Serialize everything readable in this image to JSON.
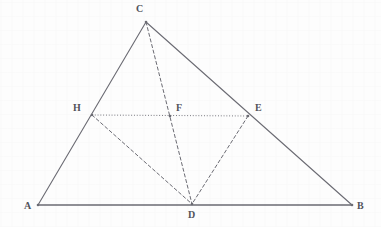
{
  "figure": {
    "width": 381,
    "height": 227,
    "background_color": "#fdfdfd",
    "stroke_color": "#6b6b73",
    "label_color": "#53535a"
  },
  "points": [
    {
      "name": "A",
      "label": "A",
      "x": 38,
      "y": 205,
      "label_x": 24,
      "label_y": 201
    },
    {
      "name": "B",
      "label": "B",
      "x": 352,
      "y": 205,
      "label_x": 357,
      "label_y": 201
    },
    {
      "name": "C",
      "label": "C",
      "x": 146,
      "y": 22,
      "label_x": 136,
      "label_y": 4
    },
    {
      "name": "D",
      "label": "D",
      "x": 192,
      "y": 204,
      "label_x": 188,
      "label_y": 210
    },
    {
      "name": "E",
      "label": "E",
      "x": 248,
      "y": 116,
      "label_x": 255,
      "label_y": 103
    },
    {
      "name": "F",
      "label": "F",
      "x": 170,
      "y": 116,
      "label_x": 176,
      "label_y": 103
    },
    {
      "name": "H",
      "label": "H",
      "x": 92,
      "y": 115,
      "label_x": 73,
      "label_y": 103
    }
  ],
  "segments": [
    {
      "name": "segment-AC",
      "from": "A",
      "to": "C",
      "style": "solid",
      "width": 1.1
    },
    {
      "name": "segment-CB",
      "from": "C",
      "to": "B",
      "style": "solid",
      "width": 1.1
    },
    {
      "name": "segment-AB",
      "from": "A",
      "to": "B",
      "style": "solid",
      "width": 1.4
    },
    {
      "name": "segment-HE",
      "from": "H",
      "to": "E",
      "style": "dotted",
      "width": 1.0
    },
    {
      "name": "segment-CD",
      "from": "C",
      "to": "D",
      "style": "dashed",
      "width": 1.0
    },
    {
      "name": "segment-HD",
      "from": "H",
      "to": "D",
      "style": "dashed",
      "width": 1.0
    },
    {
      "name": "segment-ED",
      "from": "E",
      "to": "D",
      "style": "dashed",
      "width": 1.0
    }
  ]
}
